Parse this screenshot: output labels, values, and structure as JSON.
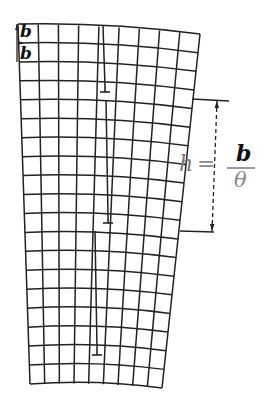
{
  "figure": {
    "labels": {
      "burgers_top": "b",
      "burgers_second": "b",
      "spacing_symbol": "h",
      "equals": "=",
      "numerator": "b",
      "denominator": "θ"
    },
    "formula": "h = b/θ",
    "dislocation_symbol": "⊥",
    "dislocations": [
      {
        "x": 105,
        "y": 92
      },
      {
        "x": 108,
        "y": 223
      },
      {
        "x": 97,
        "y": 355
      }
    ],
    "colors": {
      "lines": "#222222",
      "formula_grey": "#888888",
      "background": "#ffffff"
    }
  }
}
